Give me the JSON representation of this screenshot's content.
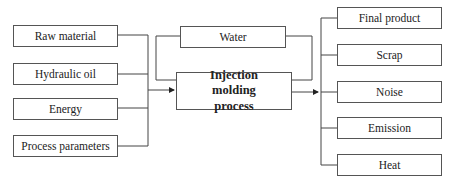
{
  "diagram": {
    "inputs": [
      {
        "label": "Raw material"
      },
      {
        "label": "Hydraulic oil"
      },
      {
        "label": "Energy"
      },
      {
        "label": "Process parameters"
      }
    ],
    "feedback": {
      "label": "Water"
    },
    "process": {
      "label": "Injection molding process"
    },
    "outputs": [
      {
        "label": "Final product"
      },
      {
        "label": "Scrap"
      },
      {
        "label": "Noise"
      },
      {
        "label": "Emission"
      },
      {
        "label": "Heat"
      }
    ]
  }
}
